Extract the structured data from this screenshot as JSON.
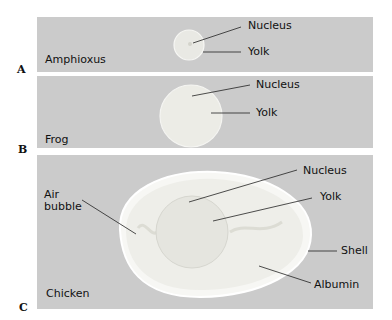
{
  "figure": {
    "panels": [
      {
        "letter": "A",
        "organism": "Amphioxus",
        "labels": [
          "Nucleus",
          "Yolk"
        ]
      },
      {
        "letter": "B",
        "organism": "Frog",
        "labels": [
          "Nucleus",
          "Yolk"
        ]
      },
      {
        "letter": "C",
        "organism": "Chicken",
        "labels": [
          "Nucleus",
          "Yolk",
          "Air bubble",
          "Shell",
          "Albumin"
        ]
      }
    ]
  },
  "colors": {
    "panel_bg": "#cbcbcb",
    "egg_fill": "#f2f2ee",
    "line": "#222222"
  }
}
